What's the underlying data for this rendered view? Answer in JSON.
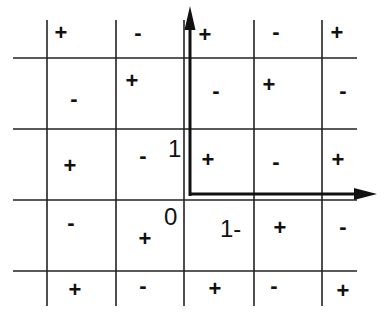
{
  "diagram": {
    "line_color": "#222222",
    "axes": {
      "x_axis": {
        "direction": "right",
        "arrow": true
      },
      "y_axis": {
        "direction": "up",
        "arrow": true
      }
    },
    "axis_labels": {
      "origin": "0",
      "y_unit": "1",
      "x_unit": "1-"
    },
    "grid": {
      "rows": 5,
      "cols": 5,
      "signs": [
        [
          "+",
          "-",
          "+",
          "-",
          "+"
        ],
        [
          "-",
          "+",
          "-",
          "+",
          "-"
        ],
        [
          "+",
          "-",
          "+",
          "-",
          "+"
        ],
        [
          "-",
          "+",
          "",
          "+",
          "-"
        ],
        [
          "+",
          "-",
          "+",
          "-",
          "+"
        ]
      ]
    }
  }
}
